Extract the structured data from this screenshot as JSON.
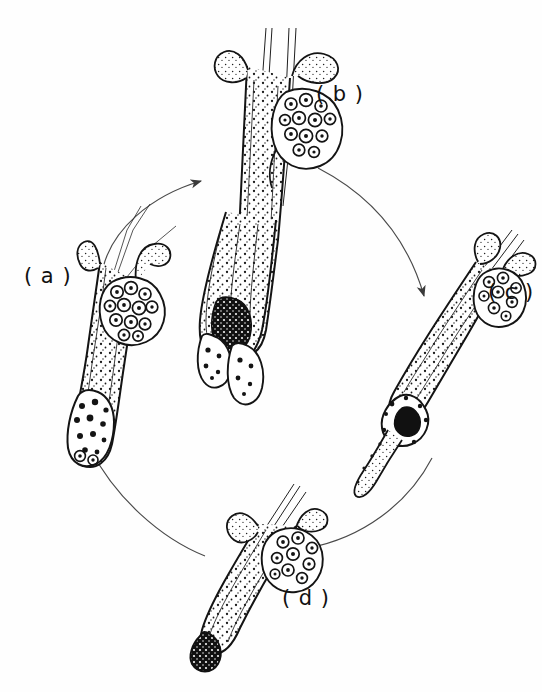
{
  "figure": {
    "kind": "scientific-line-drawing",
    "background_color": "#fefefe",
    "ink_color": "#111111",
    "arrow_color": "#444444",
    "width": 542,
    "height": 692
  },
  "labels": {
    "a": "( a )",
    "b": "( b )",
    "c": "( c )",
    "d": "( d )"
  },
  "stages": [
    {
      "id": "a",
      "label": "( a )",
      "position": "left",
      "orientation_deg": 15,
      "description": "upright follicle with sebaceous gland cluster and broad dermal papilla base",
      "has_hair_shaft": true,
      "has_sebaceous_gland": true,
      "bulb": "broad-granular"
    },
    {
      "id": "b",
      "label": "( b )",
      "position": "top",
      "orientation_deg": 0,
      "description": "elongated follicle with long hair shaft and bilobed bulbous base",
      "has_hair_shaft": true,
      "has_sebaceous_gland": true,
      "bulb": "bilobed-elongated"
    },
    {
      "id": "c",
      "label": "( c )",
      "position": "right",
      "orientation_deg": -40,
      "description": "slender oblique follicle with dark club bulb and tapering trailing strand",
      "has_hair_shaft": true,
      "has_sebaceous_gland": true,
      "bulb": "dark-club"
    },
    {
      "id": "d",
      "label": "( d )",
      "position": "bottom",
      "orientation_deg": 30,
      "description": "shortened oblique follicle with sebaceous gland and small dark terminal bulb",
      "has_hair_shaft": true,
      "has_sebaceous_gland": true,
      "bulb": "small-dark"
    }
  ],
  "arrows": [
    {
      "id": "a-to-b",
      "from": "a",
      "to": "b",
      "direction": "up-right",
      "arrowhead_at": [
        205,
        180
      ]
    },
    {
      "id": "b-to-c",
      "from": "b",
      "to": "c",
      "direction": "down-right",
      "arrowhead_at": [
        427,
        300
      ]
    },
    {
      "id": "c-to-d",
      "from": "c",
      "to": "d",
      "direction": "left-down",
      "arrowhead_at": [
        303,
        548
      ]
    },
    {
      "id": "d-to-a",
      "from": "d",
      "to": "a",
      "direction": "up-left",
      "arrowhead_at": [
        88,
        445
      ]
    }
  ]
}
